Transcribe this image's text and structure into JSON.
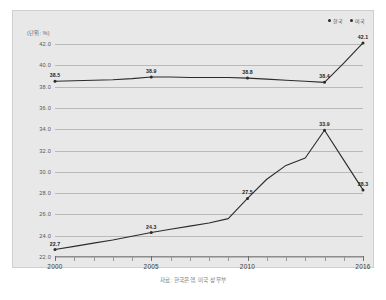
{
  "yaxis_title": "(단위: %)",
  "legend": [
    {
      "label": "한국",
      "color": "#2b2b2b"
    },
    {
      "label": "미국",
      "color": "#2b2b2b"
    }
  ],
  "caption": "자료: 한국은행, 미국 상무부",
  "chart_data": {
    "type": "line",
    "title": "",
    "xlabel": "",
    "ylabel": "(단위: %)",
    "ylim": [
      22.0,
      42.0
    ],
    "ytick_step": 2.0,
    "yticks": [
      "22.0",
      "24.0",
      "26.0",
      "28.0",
      "30.0",
      "32.0",
      "34.0",
      "36.0",
      "38.0",
      "40.0",
      "42.0"
    ],
    "xlim": [
      2000,
      2016
    ],
    "x": [
      2000,
      2001,
      2002,
      2003,
      2004,
      2005,
      2006,
      2007,
      2008,
      2009,
      2010,
      2011,
      2012,
      2013,
      2014,
      2015,
      2016
    ],
    "xtick_labels": [
      "2000",
      "2005",
      "2010",
      "2016"
    ],
    "xtick_label_years": [
      2000,
      2005,
      2010,
      2016
    ],
    "grid": true,
    "legend_position": "top-right",
    "series": [
      {
        "name": "한국",
        "color": "#2b2b2b",
        "values": [
          38.5,
          38.55,
          38.6,
          38.65,
          38.75,
          38.9,
          38.9,
          38.85,
          38.85,
          38.85,
          38.8,
          38.7,
          38.6,
          38.5,
          38.4,
          40.2,
          42.1
        ],
        "labeled_points": [
          {
            "year": 2000,
            "value": 38.5,
            "label": "38.5"
          },
          {
            "year": 2005,
            "value": 38.9,
            "label": "38.9"
          },
          {
            "year": 2010,
            "value": 38.8,
            "label": "38.8"
          },
          {
            "year": 2014,
            "value": 38.4,
            "label": "38.4"
          },
          {
            "year": 2016,
            "value": 42.1,
            "label": "42.1"
          }
        ]
      },
      {
        "name": "미국",
        "color": "#2b2b2b",
        "values": [
          22.7,
          23.0,
          23.3,
          23.6,
          23.95,
          24.3,
          24.6,
          24.9,
          25.2,
          25.6,
          27.5,
          29.3,
          30.6,
          31.3,
          33.9,
          31.1,
          28.3
        ],
        "labeled_points": [
          {
            "year": 2000,
            "value": 22.7,
            "label": "22.7"
          },
          {
            "year": 2005,
            "value": 24.3,
            "label": "24.3"
          },
          {
            "year": 2010,
            "value": 27.5,
            "label": "27.5"
          },
          {
            "year": 2014,
            "value": 33.9,
            "label": "33.9"
          },
          {
            "year": 2016,
            "value": 28.3,
            "label": "28.3"
          }
        ]
      }
    ]
  }
}
